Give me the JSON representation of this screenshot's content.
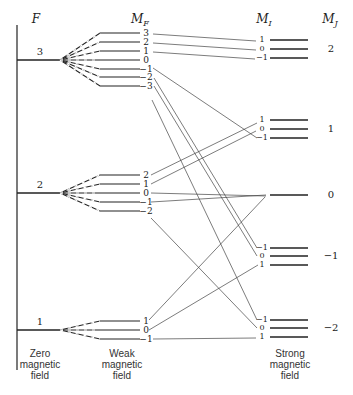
{
  "headers": {
    "F": "F",
    "MF": "M",
    "MF_sub": "F",
    "MI": "M",
    "MI_sub": "I",
    "MJ": "M",
    "MJ_sub": "J"
  },
  "captions": {
    "zero": [
      "Zero",
      "magnetic",
      "field"
    ],
    "weak": [
      "Weak",
      "magnetic",
      "field"
    ],
    "strong": [
      "Strong",
      "magnetic",
      "field"
    ]
  },
  "zero_field_levels": [
    {
      "F": "3",
      "y": 60
    },
    {
      "F": "2",
      "y": 193
    },
    {
      "F": "1",
      "y": 330
    }
  ],
  "weak_field_groups": [
    {
      "F": "3",
      "apex_y": 60,
      "levels": [
        {
          "MF": "3",
          "y": 33
        },
        {
          "MF": "2",
          "y": 42
        },
        {
          "MF": "1",
          "y": 51
        },
        {
          "MF": "0",
          "y": 60
        },
        {
          "MF": "−1",
          "y": 69
        },
        {
          "MF": "−2",
          "y": 77
        },
        {
          "MF": "−3",
          "y": 86
        }
      ]
    },
    {
      "F": "2",
      "apex_y": 193,
      "levels": [
        {
          "MF": "2",
          "y": 175
        },
        {
          "MF": "1",
          "y": 184
        },
        {
          "MF": "0",
          "y": 193
        },
        {
          "MF": "−1",
          "y": 202
        },
        {
          "MF": "−2",
          "y": 211
        }
      ]
    },
    {
      "F": "1",
      "apex_y": 330,
      "levels": [
        {
          "MF": "1",
          "y": 321
        },
        {
          "MF": "0",
          "y": 330
        },
        {
          "MF": "−1",
          "y": 339
        }
      ]
    }
  ],
  "strong_field_groups": [
    {
      "MJ": "2",
      "label_y": 49,
      "levels": [
        {
          "MI": "1",
          "y": 40
        },
        {
          "MI": "0",
          "y": 49
        },
        {
          "MI": "−1",
          "y": 58
        }
      ]
    },
    {
      "MJ": "1",
      "label_y": 129,
      "levels": [
        {
          "MI": "1",
          "y": 120
        },
        {
          "MI": "0",
          "y": 129
        },
        {
          "MI": "−1",
          "y": 138
        }
      ]
    },
    {
      "MJ": "0",
      "label_y": 195,
      "levels": [
        {
          "MI": "",
          "y": 195
        }
      ]
    },
    {
      "MJ": "−1",
      "label_y": 256,
      "levels": [
        {
          "MI": "−1",
          "y": 248
        },
        {
          "MI": "0",
          "y": 256
        },
        {
          "MI": "1",
          "y": 265
        }
      ]
    },
    {
      "MJ": "−2",
      "label_y": 328,
      "levels": [
        {
          "MI": "−1",
          "y": 320
        },
        {
          "MI": "0",
          "y": 328
        },
        {
          "MI": "1",
          "y": 337
        }
      ]
    }
  ],
  "correlation_lines": [
    {
      "from": [
        153,
        34
      ],
      "to": [
        256,
        41
      ]
    },
    {
      "from": [
        153,
        43
      ],
      "to": [
        256,
        50
      ]
    },
    {
      "from": [
        153,
        52
      ],
      "to": [
        255,
        59
      ]
    },
    {
      "from": [
        153,
        68
      ],
      "to": [
        257,
        138
      ]
    },
    {
      "from": [
        152,
        100
      ],
      "to": [
        257,
        320
      ]
    },
    {
      "from": [
        154,
        78
      ],
      "to": [
        257,
        248
      ]
    },
    {
      "from": [
        154,
        86
      ],
      "to": [
        257,
        256
      ]
    },
    {
      "from": [
        151,
        175
      ],
      "to": [
        257,
        123
      ]
    },
    {
      "from": [
        151,
        184
      ],
      "to": [
        256,
        131
      ]
    },
    {
      "from": [
        151,
        193
      ],
      "to": [
        266,
        196
      ]
    },
    {
      "from": [
        151,
        202
      ],
      "to": [
        266,
        195
      ]
    },
    {
      "from": [
        151,
        218
      ],
      "to": [
        257,
        328
      ]
    },
    {
      "from": [
        149,
        320
      ],
      "to": [
        265,
        197
      ]
    },
    {
      "from": [
        149,
        330
      ],
      "to": [
        258,
        265
      ]
    },
    {
      "from": [
        153,
        339
      ],
      "to": [
        256,
        338
      ]
    }
  ]
}
